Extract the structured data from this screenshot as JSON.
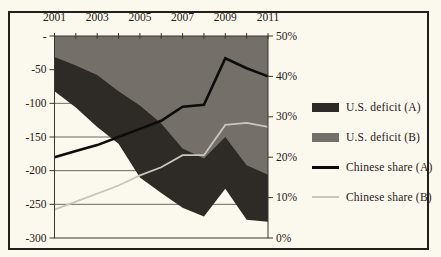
{
  "figure": {
    "background": "#fbf8ed",
    "frame_border_color": "#23201b"
  },
  "chart_data": {
    "type": "area",
    "x": [
      2001,
      2002,
      2003,
      2004,
      2005,
      2006,
      2007,
      2008,
      2009,
      2010,
      2011
    ],
    "x_tick_labels": [
      "2001",
      "2003",
      "2005",
      "2007",
      "2009",
      "2011"
    ],
    "left_axis": {
      "labels": [
        "-",
        "-50",
        "-100",
        "-150",
        "-200",
        "-250",
        "-300"
      ],
      "max": 0,
      "min": -300
    },
    "right_axis": {
      "labels": [
        "50%",
        "40%",
        "30%",
        "20%",
        "10%",
        "0%"
      ],
      "max": 50,
      "min": 0
    },
    "grid": true,
    "legend_position": "right",
    "series": [
      {
        "name": "U.S. deficit (A)",
        "type": "area",
        "axis": "left",
        "color": "#2e2b27",
        "values": [
          -82,
          -106,
          -135,
          -160,
          -210,
          -233,
          -255,
          -268,
          -227,
          -273,
          -276
        ]
      },
      {
        "name": "U.S. deficit (B)",
        "type": "area",
        "axis": "left",
        "color": "#747069",
        "values": [
          -31,
          -44,
          -58,
          -82,
          -103,
          -130,
          -167,
          -182,
          -150,
          -192,
          -206
        ]
      },
      {
        "name": "Chinese share (A)",
        "type": "line",
        "axis": "right",
        "color": "#0d0c0a",
        "stroke_width": 2.6,
        "values": [
          20,
          21.5,
          23,
          25,
          27,
          29,
          32.5,
          33,
          44.5,
          42,
          40
        ]
      },
      {
        "name": "Chinese share (B)",
        "type": "line",
        "axis": "right",
        "color": "#c9c6bd",
        "stroke_width": 1.8,
        "values": [
          7,
          9,
          11,
          13,
          15.5,
          17.5,
          20.5,
          20.5,
          28,
          28.5,
          27.5
        ]
      }
    ],
    "colors": {
      "grid": "#45423c",
      "axis": "#38352f",
      "text": "#262019"
    }
  }
}
